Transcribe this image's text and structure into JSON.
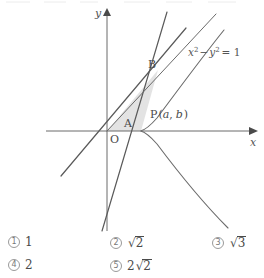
{
  "figure": {
    "axes": {
      "x_label": "x",
      "y_label": "y",
      "origin_label": "O"
    },
    "curve": {
      "equation_label": "x² − y² = 1",
      "equation_parts": {
        "x_var": "x",
        "x_exp": "2",
        "minus": "−",
        "y_var": "y",
        "y_exp": "2",
        "equals": "= 1"
      },
      "type": "hyperbola"
    },
    "points": [
      {
        "name": "origin",
        "label": "O"
      },
      {
        "name": "point-a",
        "label": "A"
      },
      {
        "name": "point-b",
        "label": "B"
      },
      {
        "name": "point-p",
        "label": "P(a, b)"
      }
    ],
    "point_p": {
      "name_letter": "P",
      "open_paren": "(",
      "coord_a": "a",
      "comma": ",",
      "coord_b": "b",
      "close_paren": ")"
    },
    "shaded_region": {
      "name": "triangle-OBP",
      "fill_color": "#e3e3e3"
    },
    "stroke_color": "#5a5a5a"
  },
  "options": [
    {
      "number": "①",
      "num_text": "1",
      "value": "1",
      "has_radical": false,
      "coefficient": "",
      "radicand": ""
    },
    {
      "number": "②",
      "num_text": "2",
      "value": "√2",
      "has_radical": true,
      "coefficient": "",
      "radicand": "2"
    },
    {
      "number": "③",
      "num_text": "3",
      "value": "√3",
      "has_radical": true,
      "coefficient": "",
      "radicand": "3"
    },
    {
      "number": "④",
      "num_text": "4",
      "value": "2",
      "has_radical": false,
      "coefficient": "",
      "radicand": ""
    },
    {
      "number": "⑤",
      "num_text": "5",
      "value": "2√2",
      "has_radical": true,
      "coefficient": "2",
      "radicand": "2"
    }
  ],
  "option_labels": {
    "o1": "1",
    "o2_rad": "2",
    "o3_rad": "3",
    "o4": "2",
    "o5_coef": "2",
    "o5_rad": "2"
  }
}
